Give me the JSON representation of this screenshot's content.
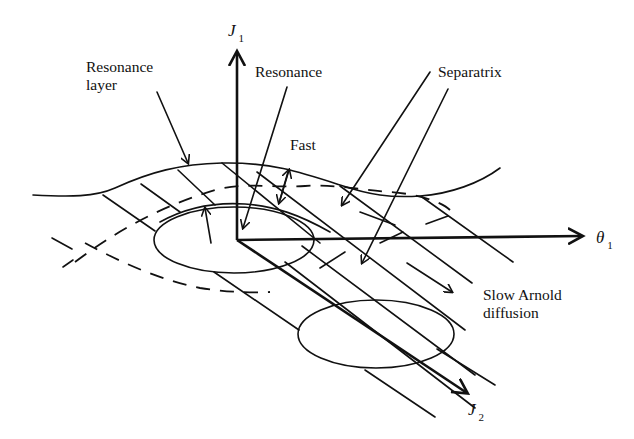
{
  "figure": {
    "axes": {
      "j1": {
        "symbol": "J",
        "subscript": "1"
      },
      "theta1": {
        "symbol": "θ",
        "subscript": "1"
      },
      "j2": {
        "symbol": "J",
        "subscript": "2"
      }
    },
    "labels": {
      "resonance_layer_line1": "Resonance",
      "resonance_layer_line2": "layer",
      "resonance": "Resonance",
      "fast": "Fast",
      "separatrix": "Separatrix",
      "slow_arnold_line1": "Slow Arnold",
      "slow_arnold_line2": "diffusion"
    },
    "colors": {
      "ink": "#111111",
      "background": "#ffffff"
    }
  }
}
